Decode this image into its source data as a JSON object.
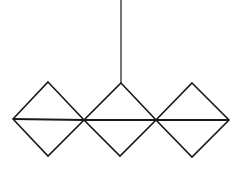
{
  "diagram": {
    "canvas": {
      "width": 244,
      "height": 172,
      "background": "#ffffff"
    },
    "stroke": {
      "color": "#1a1a1a",
      "width": 1.6
    },
    "hanger": {
      "x": 121,
      "y1": 0,
      "y2": 83
    },
    "diamonds": [
      {
        "top": [
          48,
          82
        ],
        "right": [
          84,
          120
        ],
        "bottom": [
          48,
          156
        ],
        "left": [
          13,
          119
        ]
      },
      {
        "top": [
          121,
          83
        ],
        "right": [
          156,
          120
        ],
        "bottom": [
          120,
          156
        ],
        "left": [
          84,
          120
        ]
      },
      {
        "top": [
          192,
          83
        ],
        "right": [
          229,
          120
        ],
        "bottom": [
          192,
          157
        ],
        "left": [
          156,
          120
        ]
      }
    ],
    "horizontal_diagonals": [
      {
        "x1": 13,
        "y1": 119,
        "x2": 84,
        "y2": 120
      },
      {
        "x1": 84,
        "y1": 120,
        "x2": 156,
        "y2": 120
      },
      {
        "x1": 156,
        "y1": 120,
        "x2": 229,
        "y2": 120
      }
    ]
  }
}
